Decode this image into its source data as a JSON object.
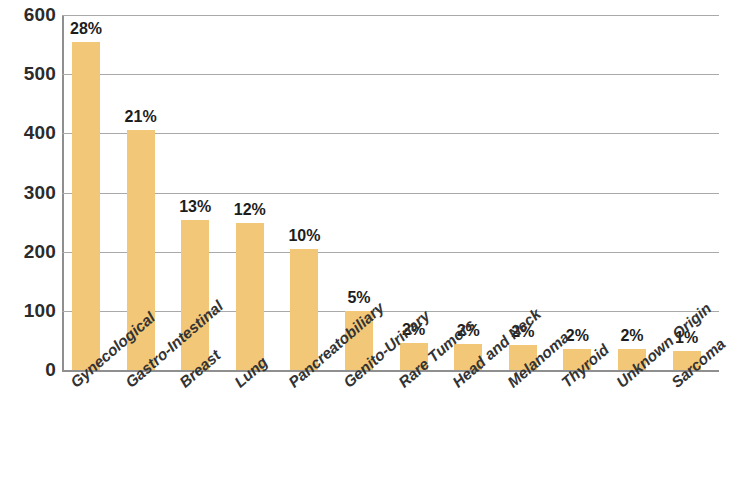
{
  "chart_data": {
    "type": "bar",
    "title": "",
    "subtitle": "",
    "xlabel": "",
    "ylabel": "",
    "ylim": [
      0,
      600
    ],
    "yticks": [
      0,
      100,
      200,
      300,
      400,
      500,
      600
    ],
    "ytick_labels": [
      "0",
      "100",
      "200",
      "300",
      "400",
      "500",
      "600"
    ],
    "grid": true,
    "legend": false,
    "bar_color": "#F2C777",
    "categories": [
      "Gynecological",
      "Gastro-Intestinal",
      "Breast",
      "Lung",
      "Pancreatobiliary",
      "Genito-Urinary",
      "Rare Tumors",
      "Head and Neck",
      "Melanoma",
      "Thyroid",
      "Unknown Origin",
      "Sarcoma"
    ],
    "values": [
      555,
      405,
      253,
      248,
      205,
      100,
      45,
      44,
      42,
      36,
      36,
      32
    ],
    "data_labels": [
      "28%",
      "21%",
      "13%",
      "12%",
      "10%",
      "5%",
      "2%",
      "2%",
      "2%",
      "2%",
      "2%",
      "1%"
    ]
  },
  "axis": {
    "y_tick_600": "600",
    "y_tick_500": "500",
    "y_tick_400": "400",
    "y_tick_300": "300",
    "y_tick_200": "200",
    "y_tick_100": "100",
    "y_tick_0": "0"
  }
}
